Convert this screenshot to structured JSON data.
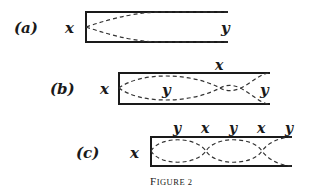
{
  "figure": {
    "caption": "Figure 2",
    "colors": {
      "ink": "#1a1a1a",
      "wave": "#333333",
      "background": "#ffffff"
    },
    "panels": [
      {
        "id": "a",
        "label": "(a)",
        "open_end_label": "x",
        "closed_end_label": "y",
        "top_labels": [],
        "inner_labels": [],
        "description": "fundamental: quarter wavelength, node at closed end x, antinode at open end y"
      },
      {
        "id": "b",
        "label": "(b)",
        "open_end_label": "x",
        "top_labels": [
          "x"
        ],
        "inner_labels": [
          "y",
          "y"
        ],
        "description": "three-quarter wavelength standing wave"
      },
      {
        "id": "c",
        "label": "(c)",
        "open_end_label": "x",
        "top_labels": [
          "y",
          "x",
          "y",
          "x",
          "y"
        ],
        "inner_labels": [],
        "description": "five-quarter wavelength standing wave"
      }
    ]
  }
}
